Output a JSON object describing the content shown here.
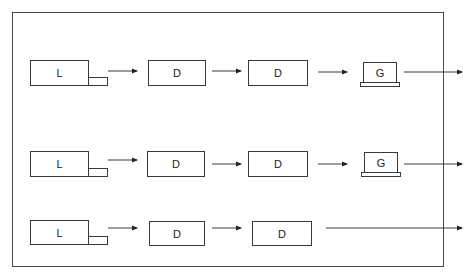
{
  "diagram": {
    "rows": [
      {
        "nodes": [
          {
            "type": "L",
            "label": "L"
          },
          {
            "type": "D",
            "label": "D"
          },
          {
            "type": "D",
            "label": "D"
          },
          {
            "type": "G",
            "label": "G"
          }
        ]
      },
      {
        "nodes": [
          {
            "type": "L",
            "label": "L"
          },
          {
            "type": "D",
            "label": "D"
          },
          {
            "type": "D",
            "label": "D"
          },
          {
            "type": "G",
            "label": "G"
          }
        ]
      },
      {
        "nodes": [
          {
            "type": "L",
            "label": "L"
          },
          {
            "type": "D",
            "label": "D"
          },
          {
            "type": "D",
            "label": "D"
          }
        ]
      }
    ],
    "colors": {
      "line": "#3a3a3a",
      "frame": "#4a4a4a",
      "background": "#ffffff"
    }
  }
}
